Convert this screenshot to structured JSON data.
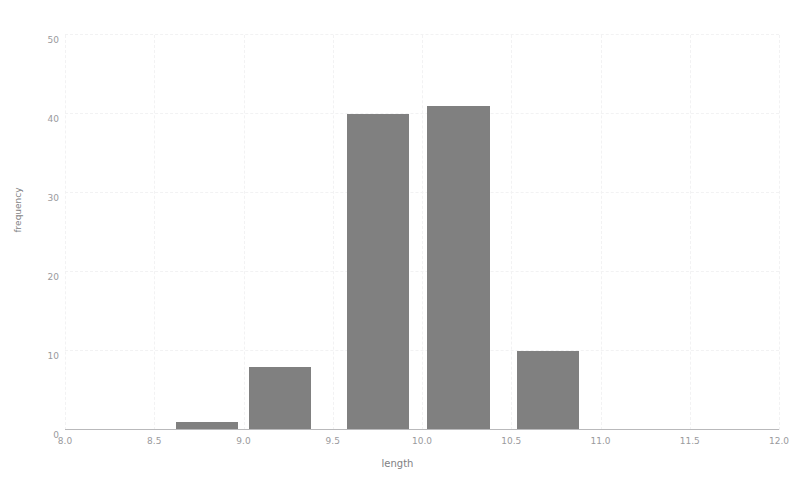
{
  "chart_data": {
    "type": "bar",
    "title": "",
    "subtitle": "",
    "xlabel": "length",
    "ylabel": "frequency",
    "xlim": [
      8.0,
      12.0
    ],
    "ylim": [
      0,
      50
    ],
    "grid": true,
    "legend": null,
    "bar_color": "#808080",
    "background_color": "#ffffff",
    "gridline_color": "#f2f2f3",
    "axis_color": "#b9b9bb",
    "tick_label_color": "#9a9a9d",
    "xticks": [
      8.0,
      8.5,
      9.0,
      9.5,
      10.0,
      10.5,
      11.0,
      11.5,
      12.0
    ],
    "xtick_labels": [
      "8.0",
      "8.5",
      "9.0",
      "9.5",
      "10.0",
      "10.5",
      "11.0",
      "11.5",
      "12.0"
    ],
    "yticks": [
      0,
      10,
      20,
      30,
      40,
      50
    ],
    "ytick_labels": [
      "0",
      "10",
      "20",
      "30",
      "40",
      "50"
    ],
    "bins": [
      {
        "left": 8.62,
        "right": 8.97,
        "value": 1
      },
      {
        "left": 9.03,
        "right": 9.38,
        "value": 8
      },
      {
        "left": 9.58,
        "right": 9.93,
        "value": 40
      },
      {
        "left": 10.03,
        "right": 10.38,
        "value": 41
      },
      {
        "left": 10.53,
        "right": 10.88,
        "value": 10
      }
    ],
    "categories": [
      "8.62-8.97",
      "9.03-9.38",
      "9.58-9.93",
      "10.03-10.38",
      "10.53-10.88"
    ],
    "values": [
      1,
      8,
      40,
      41,
      10
    ]
  }
}
